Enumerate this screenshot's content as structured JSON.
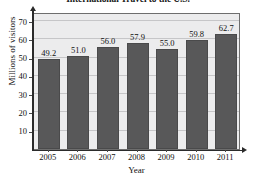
{
  "chart_data": {
    "type": "bar",
    "title": "International Travel to the U.S.",
    "xlabel": "Year",
    "ylabel": "Millions of visitors",
    "categories": [
      "2005",
      "2006",
      "2007",
      "2008",
      "2009",
      "2010",
      "2011"
    ],
    "values": [
      49.2,
      51.0,
      56.0,
      57.9,
      55.0,
      59.8,
      62.7
    ],
    "value_labels": [
      "49.2",
      "51.0",
      "56.0",
      "57.9",
      "55.0",
      "59.8",
      "62.7"
    ],
    "ylim": [
      0,
      75
    ],
    "yticks": [
      10,
      20,
      30,
      40,
      50,
      60,
      70
    ],
    "ytick_labels": [
      "10",
      "20",
      "30",
      "40",
      "50",
      "60",
      "70"
    ],
    "grid": true,
    "legend": false,
    "bar_color": "#585859",
    "plot_background": "#ececed",
    "gridline_color": "#c6c6c8",
    "axis_color": "#2b2b2b"
  }
}
